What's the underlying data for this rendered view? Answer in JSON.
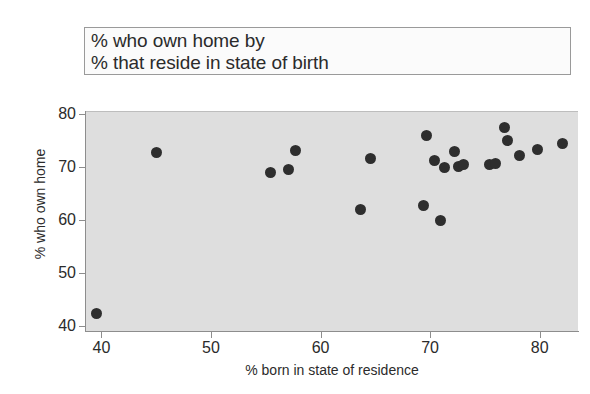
{
  "title": {
    "line1": "% who own home by",
    "line2": "% that reside in state of birth"
  },
  "axis": {
    "x_label": "% born in state of residence",
    "y_label": "% who own home",
    "x_ticks": [
      "40",
      "50",
      "60",
      "70",
      "80"
    ],
    "y_ticks": [
      "80",
      "70",
      "60",
      "50",
      "40"
    ]
  },
  "colors": {
    "panel_background": "#dedede",
    "point": "#2e2e2e",
    "axis": "#8d8d8d",
    "text": "#2b2b2b",
    "page_background": "#ffffff"
  },
  "chart_data": {
    "type": "scatter",
    "title": "% who own home by % that reside in state of birth",
    "xlabel": "% born in state of residence",
    "ylabel": "% who own home",
    "xlim": [
      38.5,
      83.5
    ],
    "ylim": [
      39.0,
      80.5
    ],
    "xticks": [
      40,
      50,
      60,
      70,
      80
    ],
    "yticks": [
      40,
      50,
      60,
      70,
      80
    ],
    "grid": false,
    "legend": null,
    "marker": "filled-circle",
    "points": [
      {
        "x": 39.5,
        "y": 42.5
      },
      {
        "x": 44.9,
        "y": 72.8
      },
      {
        "x": 55.3,
        "y": 69.1
      },
      {
        "x": 57.0,
        "y": 69.7
      },
      {
        "x": 57.6,
        "y": 73.2
      },
      {
        "x": 63.6,
        "y": 62.2
      },
      {
        "x": 64.5,
        "y": 71.7
      },
      {
        "x": 69.3,
        "y": 62.9
      },
      {
        "x": 69.6,
        "y": 76.1
      },
      {
        "x": 70.3,
        "y": 71.4
      },
      {
        "x": 70.9,
        "y": 60.1
      },
      {
        "x": 71.2,
        "y": 70.0
      },
      {
        "x": 72.1,
        "y": 73.0
      },
      {
        "x": 72.5,
        "y": 70.2
      },
      {
        "x": 73.0,
        "y": 70.6
      },
      {
        "x": 75.3,
        "y": 70.6
      },
      {
        "x": 75.9,
        "y": 70.8
      },
      {
        "x": 76.7,
        "y": 77.6
      },
      {
        "x": 77.0,
        "y": 75.2
      },
      {
        "x": 78.1,
        "y": 72.3
      },
      {
        "x": 79.7,
        "y": 73.5
      },
      {
        "x": 82.0,
        "y": 74.6
      }
    ]
  }
}
